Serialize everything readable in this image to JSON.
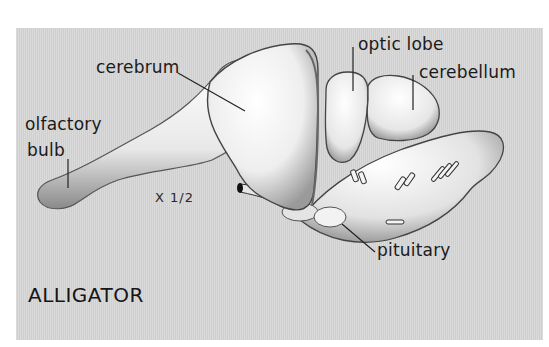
{
  "figure": {
    "title": "ALLIGATOR",
    "scale": "X 1/2",
    "background_color": "#d6d6d6",
    "labels": {
      "cerebrum": "cerebrum",
      "optic_lobe": "optic lobe",
      "cerebellum": "cerebellum",
      "olfactory_line1": "olfactory",
      "olfactory_line2": "bulb",
      "pituitary": "pituitary"
    }
  }
}
